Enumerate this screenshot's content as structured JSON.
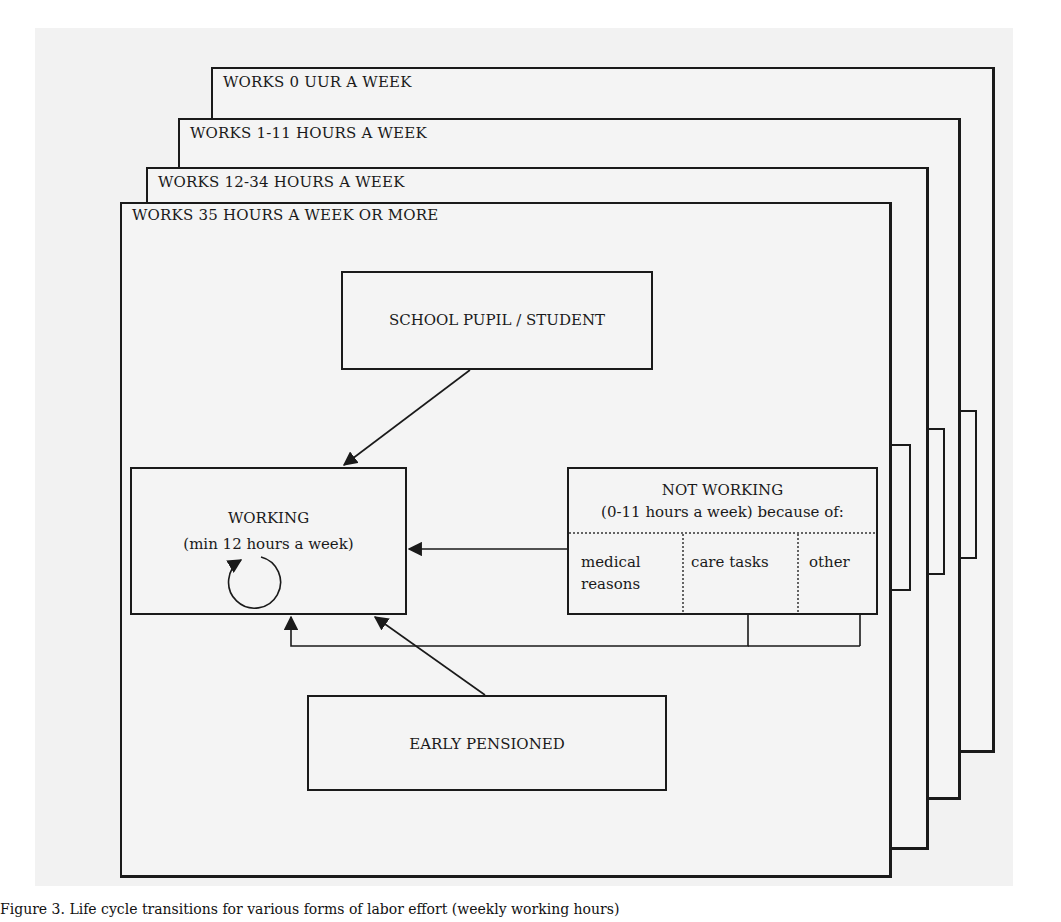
{
  "layers": [
    {
      "id": "layer-0",
      "title": "WORKS 0 UUR A WEEK"
    },
    {
      "id": "layer-1-11",
      "title": "WORKS 1-11 HOURS A WEEK"
    },
    {
      "id": "layer-12-34",
      "title": "WORKS 12-34 HOURS A WEEK"
    },
    {
      "id": "layer-35",
      "title": "WORKS 35 HOURS A WEEK OR MORE"
    }
  ],
  "nodes": {
    "school": {
      "label": "SCHOOL PUPIL / STUDENT"
    },
    "working": {
      "title": "WORKING",
      "subtitle": "(min 12 hours a week)"
    },
    "not_working": {
      "title": "NOT WORKING",
      "subtitle": "(0-11 hours a week) because of:",
      "reasons": [
        "medical reasons",
        "care tasks",
        "other"
      ]
    },
    "early_pensioned": {
      "label": "EARLY PENSIONED"
    }
  },
  "edges": [
    {
      "from": "school",
      "to": "working"
    },
    {
      "from": "not_working",
      "to": "working"
    },
    {
      "from": "early_pensioned",
      "to": "working"
    },
    {
      "from": "not_working.care_tasks",
      "to": "working"
    },
    {
      "from": "not_working.other",
      "to": "working"
    },
    {
      "from": "working",
      "to": "working",
      "type": "self-loop"
    }
  ],
  "caption": "Figure 3. Life cycle transitions for various forms of labor effort (weekly working hours)"
}
